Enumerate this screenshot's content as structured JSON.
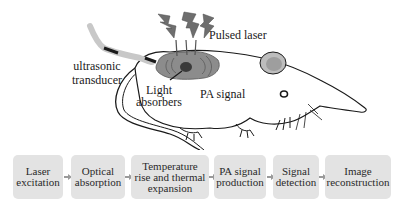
{
  "labels": {
    "pulsed_laser": "Pulsed laser",
    "transducer_line1": "ultrasonic",
    "transducer_line2": "transducer",
    "absorbers_line1": "Light",
    "absorbers_line2": "absorbers",
    "pa_signal": "PA signal"
  },
  "flow": {
    "steps": [
      {
        "line1": "Laser",
        "line2": "excitation",
        "line3": ""
      },
      {
        "line1": "Optical",
        "line2": "absorption",
        "line3": ""
      },
      {
        "line1": "Temperature",
        "line2": "rise and thermal",
        "line3": "expansion"
      },
      {
        "line1": "PA signal",
        "line2": "production",
        "line3": ""
      },
      {
        "line1": "Signal",
        "line2": "detection",
        "line3": ""
      },
      {
        "line1": "Image",
        "line2": "reconstruction",
        "line3": ""
      }
    ]
  },
  "colors": {
    "box_fill": "#e3e3e3",
    "arrow": "#9a9a9a",
    "laser_bolt": "#6e6e6e",
    "tissue": "#8c8c8c",
    "absorber": "#3a3a3a",
    "outline": "#1a1a1a"
  }
}
